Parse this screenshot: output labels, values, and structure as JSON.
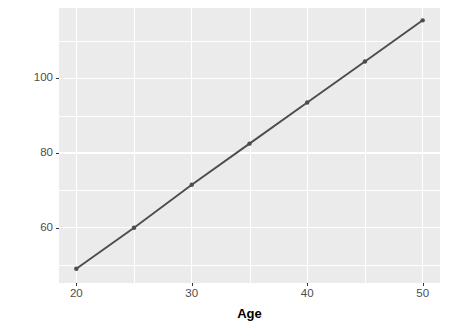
{
  "chart_data": {
    "type": "line",
    "title": "",
    "subtitle": "",
    "xlabel": "Age",
    "ylabel": "Logit",
    "x": [
      20,
      25,
      30,
      35,
      40,
      45,
      50
    ],
    "values": [
      49,
      60,
      71.5,
      82.5,
      93.5,
      104.5,
      115.5
    ],
    "series": [
      {
        "name": "Logit",
        "x": [
          20,
          25,
          30,
          35,
          40,
          45,
          50
        ],
        "values": [
          49,
          60,
          71.5,
          82.5,
          93.5,
          104.5,
          115.5
        ]
      }
    ],
    "xlim": [
      18.5,
      51.5
    ],
    "ylim": [
      45.2,
      118.8
    ],
    "x_ticks": [
      20,
      30,
      40,
      50
    ],
    "x_tick_labels": [
      "20",
      "30",
      "40",
      "50"
    ],
    "x_minor_ticks": [
      25,
      35,
      45
    ],
    "y_ticks": [
      60,
      80,
      100
    ],
    "y_tick_labels": [
      "60",
      "80",
      "100"
    ],
    "y_minor_ticks": [
      50,
      70,
      90,
      110
    ],
    "grid": true,
    "legend": "none",
    "marker": "circle",
    "colors": {
      "panel_background": "#ebebeb",
      "grid": "#ffffff",
      "line": "#4d4d4d",
      "point": "#4d4d4d",
      "axis_text": "#4d4d4d",
      "axis_title": "#000000",
      "figure_background": "#ffffff"
    }
  }
}
